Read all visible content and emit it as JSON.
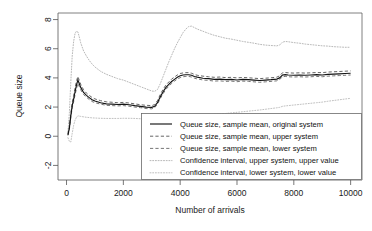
{
  "chart_data": {
    "type": "line",
    "title": "",
    "xlabel": "Number of arrivals",
    "ylabel": "Queue size",
    "xlim": [
      -300,
      10400
    ],
    "ylim": [
      -3.0,
      8.45
    ],
    "xticks": [
      0,
      2000,
      4000,
      6000,
      8000,
      10000
    ],
    "xtick_labels": [
      "0",
      "2000",
      "4000",
      "6000",
      "8000",
      "10000"
    ],
    "yticks": [
      -2,
      0,
      2,
      4,
      6,
      8
    ],
    "ytick_labels": [
      "-2",
      "0",
      "2",
      "4",
      "6",
      "8"
    ],
    "grid": false,
    "legend_position": "bottom-right",
    "x": [
      50,
      100,
      150,
      200,
      250,
      300,
      350,
      400,
      450,
      500,
      600,
      700,
      800,
      900,
      1000,
      1200,
      1400,
      1600,
      1800,
      2000,
      2200,
      2400,
      2600,
      2800,
      3000,
      3100,
      3200,
      3300,
      3400,
      3500,
      3600,
      3700,
      3800,
      3900,
      4000,
      4100,
      4200,
      4300,
      4400,
      4500,
      4600,
      4800,
      5000,
      5200,
      5400,
      5600,
      5800,
      6000,
      6200,
      6400,
      6600,
      6800,
      7000,
      7200,
      7400,
      7500,
      7600,
      7700,
      7800,
      8000,
      8200,
      8400,
      8600,
      8800,
      9000,
      9200,
      9400,
      9600,
      9800,
      10000
    ],
    "series": [
      {
        "name": "Queue size, sample mean, original system",
        "style": "solid",
        "color": "#141414",
        "values": [
          0.1,
          0.55,
          1.4,
          2.1,
          2.55,
          3.05,
          3.5,
          3.85,
          3.6,
          3.35,
          3.0,
          2.8,
          2.65,
          2.5,
          2.42,
          2.3,
          2.22,
          2.2,
          2.18,
          2.2,
          2.16,
          2.1,
          2.05,
          2.0,
          1.98,
          2.05,
          2.3,
          2.7,
          3.05,
          3.35,
          3.55,
          3.75,
          3.9,
          4.05,
          4.15,
          4.2,
          4.22,
          4.22,
          4.18,
          4.1,
          4.05,
          3.98,
          3.95,
          3.9,
          3.92,
          3.88,
          3.9,
          3.86,
          3.9,
          3.88,
          3.85,
          3.82,
          3.85,
          3.88,
          3.92,
          4.0,
          4.2,
          4.22,
          4.2,
          4.18,
          4.2,
          4.18,
          4.2,
          4.22,
          4.2,
          4.24,
          4.26,
          4.28,
          4.3,
          4.32
        ]
      },
      {
        "name": "Queue size, sample mean, upper system",
        "style": "dashed",
        "color": "#5c5c5c",
        "values": [
          0.16,
          0.66,
          1.56,
          2.3,
          2.78,
          3.3,
          3.78,
          4.1,
          3.82,
          3.56,
          3.18,
          2.96,
          2.8,
          2.66,
          2.56,
          2.44,
          2.36,
          2.33,
          2.3,
          2.32,
          2.28,
          2.22,
          2.16,
          2.12,
          2.1,
          2.17,
          2.44,
          2.86,
          3.22,
          3.52,
          3.72,
          3.92,
          4.06,
          4.2,
          4.3,
          4.34,
          4.36,
          4.36,
          4.32,
          4.24,
          4.18,
          4.12,
          4.08,
          4.04,
          4.06,
          4.02,
          4.04,
          4.0,
          4.03,
          4.01,
          3.98,
          3.95,
          3.98,
          4.01,
          4.05,
          4.14,
          4.35,
          4.37,
          4.35,
          4.33,
          4.35,
          4.33,
          4.35,
          4.37,
          4.36,
          4.4,
          4.42,
          4.44,
          4.46,
          4.48
        ]
      },
      {
        "name": "Queue size, sample mean, lower system",
        "style": "dashed",
        "color": "#6e6e6e",
        "values": [
          0.05,
          0.46,
          1.28,
          1.94,
          2.36,
          2.84,
          3.26,
          3.62,
          3.4,
          3.18,
          2.86,
          2.68,
          2.52,
          2.38,
          2.3,
          2.2,
          2.12,
          2.1,
          2.08,
          2.1,
          2.06,
          2.0,
          1.96,
          1.9,
          1.88,
          1.95,
          2.2,
          2.58,
          2.92,
          3.22,
          3.42,
          3.62,
          3.78,
          3.92,
          4.02,
          4.08,
          4.1,
          4.1,
          4.06,
          3.98,
          3.93,
          3.86,
          3.83,
          3.78,
          3.8,
          3.76,
          3.78,
          3.74,
          3.78,
          3.76,
          3.73,
          3.7,
          3.73,
          3.76,
          3.8,
          3.88,
          4.08,
          4.1,
          4.08,
          4.06,
          4.08,
          4.06,
          4.08,
          4.1,
          4.08,
          4.12,
          4.14,
          4.16,
          4.18,
          4.2
        ]
      },
      {
        "name": "Confidence interval, upper system, upper value",
        "style": "dotted",
        "color": "#b4b4b4",
        "values": [
          0.3,
          1.6,
          3.7,
          5.5,
          6.5,
          7.05,
          7.2,
          7.15,
          6.8,
          6.4,
          5.85,
          5.5,
          5.2,
          4.95,
          4.75,
          4.45,
          4.25,
          4.1,
          3.95,
          3.85,
          3.7,
          3.55,
          3.4,
          3.25,
          3.1,
          3.08,
          3.2,
          3.6,
          4.1,
          4.6,
          5.1,
          5.55,
          6.0,
          6.4,
          6.75,
          7.1,
          7.35,
          7.52,
          7.55,
          7.45,
          7.35,
          7.2,
          7.05,
          6.92,
          6.82,
          6.72,
          6.66,
          6.58,
          6.5,
          6.44,
          6.38,
          6.3,
          6.25,
          6.22,
          6.2,
          6.25,
          6.45,
          6.5,
          6.48,
          6.42,
          6.38,
          6.32,
          6.28,
          6.24,
          6.2,
          6.18,
          6.14,
          6.12,
          6.1,
          6.1
        ]
      },
      {
        "name": "Confidence interval, lower system, lower value",
        "style": "dotted",
        "color": "#bdbdbd",
        "values": [
          -0.1,
          -0.35,
          -0.4,
          0.2,
          0.75,
          1.1,
          1.3,
          1.4,
          1.38,
          1.36,
          1.33,
          1.3,
          1.28,
          1.26,
          1.25,
          1.23,
          1.22,
          1.22,
          1.22,
          1.23,
          1.23,
          1.22,
          1.2,
          1.18,
          1.16,
          1.16,
          1.18,
          1.2,
          1.22,
          1.24,
          1.26,
          1.28,
          1.3,
          1.32,
          1.34,
          1.36,
          1.38,
          1.4,
          1.41,
          1.42,
          1.43,
          1.45,
          1.47,
          1.5,
          1.53,
          1.56,
          1.6,
          1.64,
          1.68,
          1.72,
          1.76,
          1.8,
          1.85,
          1.9,
          1.95,
          1.98,
          2.05,
          2.08,
          2.1,
          2.14,
          2.18,
          2.22,
          2.26,
          2.3,
          2.34,
          2.4,
          2.45,
          2.5,
          2.55,
          2.6
        ]
      }
    ],
    "legend": [
      "Queue size, sample mean, original system",
      "Queue size, sample mean, upper system",
      "Queue size, sample mean, lower system",
      "Confidence interval, upper system, upper value",
      "Confidence interval, lower system, lower value"
    ]
  },
  "colors": {
    "original": "#141414",
    "upper_mean": "#5c5c5c",
    "lower_mean": "#6e6e6e",
    "ci_upper": "#b4b4b4",
    "ci_lower": "#bdbdbd",
    "axis": "#555555",
    "background": "#ffffff"
  }
}
